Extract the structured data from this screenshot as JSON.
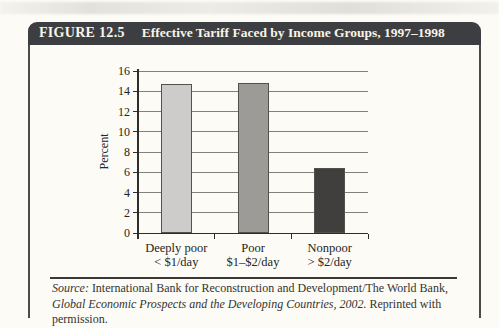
{
  "figure": {
    "label": "FIGURE 12.5",
    "title": "Effective Tariff Faced by Income Groups, 1997–1998"
  },
  "chart_data": {
    "type": "bar",
    "title": "Effective Tariff Faced by Income Groups, 1997–1998",
    "xlabel": "",
    "ylabel": "Percent",
    "ylim": [
      0,
      16
    ],
    "ytick_step": 2,
    "grid": true,
    "legend": false,
    "categories": [
      [
        "Deeply poor",
        "< $1/day"
      ],
      [
        "Poor",
        "$1–$2/day"
      ],
      [
        "Nonpoor",
        "> $2/day"
      ]
    ],
    "values": [
      14.7,
      14.8,
      6.4
    ],
    "bar_colors": [
      "#cdccca",
      "#9c9b98",
      "#403f3d"
    ]
  },
  "source": {
    "label_italic": "Source:",
    "text_plain_1": " International Bank for Reconstruction and Development/The World Bank, ",
    "title_italic": "Global Economic Prospects and the Developing Countries, 2002.",
    "text_plain_2": " Reprinted with permission."
  },
  "colors": {
    "header_bg": "#3d3e41",
    "header_text": "#f8f4e6",
    "frame_border": "#4c4b49",
    "paper_bg": "#fcfbf6",
    "gridline": "#82807d",
    "axis": "#2e2d2b"
  }
}
